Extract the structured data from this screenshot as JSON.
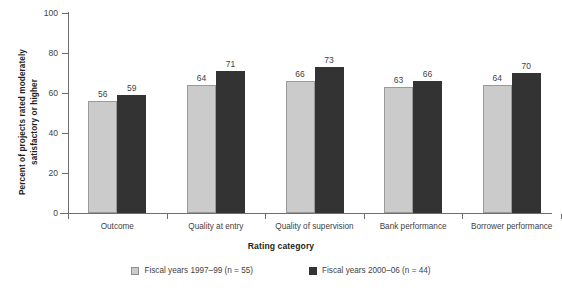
{
  "chart_data": {
    "type": "bar",
    "title": "",
    "xlabel": "Rating category",
    "ylabel_line1": "Percent of projects rated moderately",
    "ylabel_line2": "satisfactory or higher",
    "categories": [
      "Outcome",
      "Quality at entry",
      "Quality of supervision",
      "Bank performance",
      "Borrower performance"
    ],
    "series": [
      {
        "name": "Fiscal years 1997–99 (n = 55)",
        "color": "#cbcbcb",
        "values": [
          56,
          64,
          66,
          63,
          64
        ]
      },
      {
        "name": "Fiscal years 2000–06 (n = 44)",
        "color": "#333333",
        "values": [
          59,
          71,
          73,
          66,
          70
        ]
      }
    ],
    "ylim": [
      0,
      100
    ],
    "yticks": [
      0,
      20,
      40,
      60,
      80,
      100
    ],
    "ytick_labels": [
      "0",
      "20",
      "40",
      "60",
      "80",
      "100"
    ],
    "grid": false,
    "legend_position": "bottom"
  },
  "legend": {
    "items": [
      {
        "label": "Fiscal years 1997–99 (n = 55)",
        "swatch": "light"
      },
      {
        "label": "Fiscal years 2000–06 (n = 44)",
        "swatch": "dark"
      }
    ]
  },
  "axes": {
    "x_title": "Rating category",
    "y_title_line1": "Percent of projects rated moderately",
    "y_title_line2": "satisfactory or higher"
  }
}
